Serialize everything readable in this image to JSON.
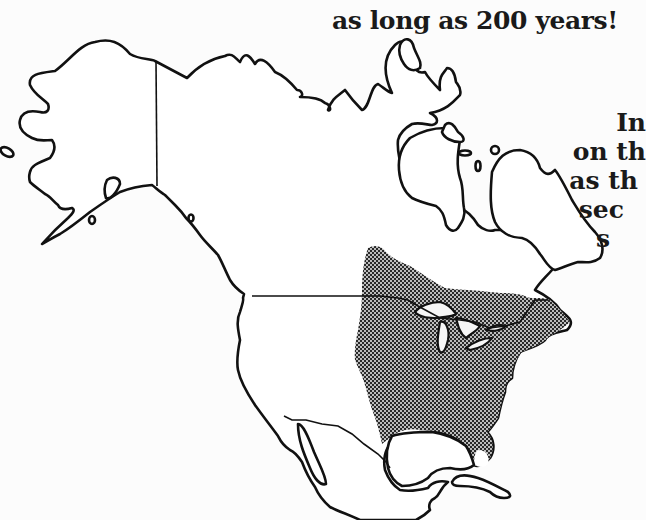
{
  "caption": {
    "top_line": "as long as 200 years!",
    "side_lines": [
      "In",
      "on th",
      "as th",
      "sec",
      "s"
    ]
  },
  "map": {
    "title": "North America range map",
    "regions": [
      "Alaska",
      "Canada",
      "United States",
      "Mexico",
      "Greenland",
      "Cuba"
    ],
    "shaded_region_label": "species range (eastern North America)",
    "colors": {
      "outline": "#111111",
      "land": "#ffffff",
      "range_dark": "#2a2a2a",
      "range_light": "#bdbdbd"
    }
  }
}
